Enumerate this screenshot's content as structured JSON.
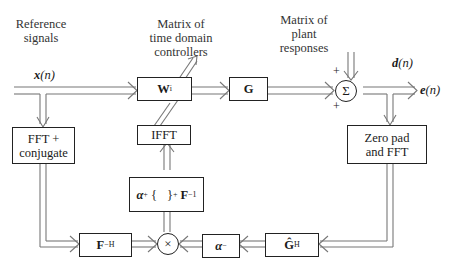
{
  "labels": {
    "reference": "Reference signals",
    "reference_l1": "Reference",
    "reference_l2": "signals",
    "controllers_l1": "Matrix of",
    "controllers_l2": "time domain",
    "controllers_l3": "controllers",
    "plant_l1": "Matrix of",
    "plant_l2": "plant",
    "plant_l3": "responses"
  },
  "signals": {
    "x": "x",
    "x_arg": "(n)",
    "d": "d",
    "d_arg": "(n)",
    "e": "e",
    "e_arg": "(n)"
  },
  "blocks": {
    "W": "W",
    "W_sub": "i",
    "G": "G",
    "fft_l1": "FFT +",
    "fft_l2": "conjugate",
    "ifft": "IFFT",
    "zeropad_l1": "Zero pad",
    "zeropad_l2": "and FFT",
    "FH": "F",
    "FH_sup": "−H",
    "alpha_plus": "α",
    "alpha_plus_sup": "+",
    "brace_open": "{",
    "brace_close": "}",
    "brace_sub": "+",
    "F_inv": "F",
    "F_inv_sup": "−1",
    "alpha_minus": "α",
    "alpha_minus_sup": "−",
    "GH": "Ĝ",
    "GH_sup": "H"
  },
  "junctions": {
    "sum": "Σ",
    "mult": "×",
    "plus_top": "+",
    "plus_bottom": "+"
  }
}
